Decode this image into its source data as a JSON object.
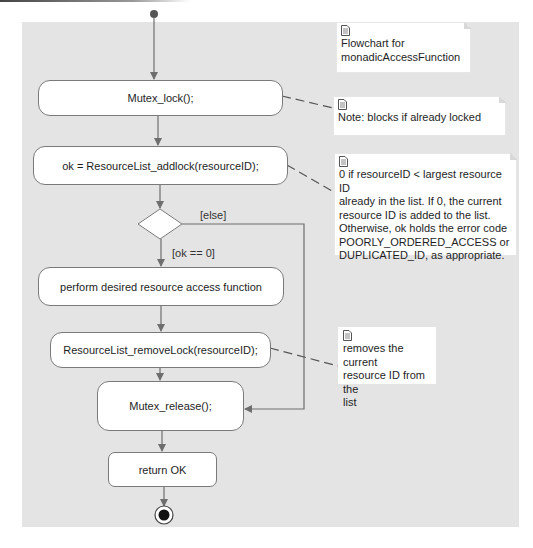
{
  "diagram": {
    "type": "uml-activity-diagram",
    "title_note": "Flowchart for monadicAccessFunction",
    "nodes": {
      "start": "initial-node",
      "mutex_lock": "Mutex_lock();",
      "addlock": "ok = ResourceList_addlock(resourceID);",
      "decision": "decision-node",
      "perform": "perform desired resource access function",
      "remove_lock": "ResourceList_removeLock(resourceID);",
      "mutex_release": "Mutex_release();",
      "return_ok": "return OK",
      "end": "final-node"
    },
    "guards": {
      "else": "[else]",
      "ok_zero": "[ok == 0]"
    },
    "notes": {
      "title": [
        "Flowchart for",
        "monadicAccessFunction"
      ],
      "mutex_lock": [
        "Note: blocks if already locked"
      ],
      "addlock": [
        "0 if  resourceID < largest resource ID",
        "already in the list. If 0, the current",
        "resource ID is added to the list.",
        "Otherwise, ok holds the error code",
        "POORLY_ORDERED_ACCESS or",
        "DUPLICATED_ID, as appropriate."
      ],
      "remove_lock": [
        "removes the current",
        "resource ID from the",
        "list"
      ]
    },
    "edges": [
      {
        "from": "start",
        "to": "mutex_lock"
      },
      {
        "from": "mutex_lock",
        "to": "addlock"
      },
      {
        "from": "addlock",
        "to": "decision"
      },
      {
        "from": "decision",
        "to": "perform",
        "guard": "[ok == 0]"
      },
      {
        "from": "decision",
        "to": "mutex_release",
        "guard": "[else]"
      },
      {
        "from": "perform",
        "to": "remove_lock"
      },
      {
        "from": "remove_lock",
        "to": "mutex_release"
      },
      {
        "from": "mutex_release",
        "to": "return_ok"
      },
      {
        "from": "return_ok",
        "to": "end"
      }
    ],
    "colors": {
      "canvas": "#e4e4e4",
      "node_fill": "#ffffff",
      "node_border": "#7a7a7a",
      "edge": "#6e6e6e"
    }
  }
}
